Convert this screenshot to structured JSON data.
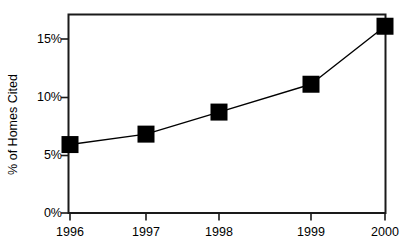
{
  "chart_data": {
    "type": "line",
    "title": "",
    "xlabel": "",
    "ylabel": "% of Homes Cited",
    "categories": [
      "1996",
      "1997",
      "1998",
      "1999",
      "2000"
    ],
    "values": [
      5.9,
      6.8,
      8.7,
      11.1,
      16.1
    ],
    "series": [
      {
        "name": "% of Homes Cited",
        "values": [
          5.9,
          6.8,
          8.7,
          11.1,
          16.1
        ]
      }
    ],
    "ylim": [
      0,
      17.25
    ],
    "xlim": [
      "1996",
      "2000"
    ],
    "y_ticks": [
      0,
      5,
      10,
      15
    ],
    "y_tick_labels": [
      "0%",
      "5%",
      "10%",
      "15%"
    ],
    "x_ticks": [
      "1996",
      "1997",
      "1998",
      "1999",
      "2000"
    ],
    "grid": false,
    "legend": "none",
    "marker": "square",
    "marker_color": "#000000",
    "line_color": "#000000",
    "frame_color": "#1a1a1a",
    "background_color": "#ffffff"
  },
  "axes": {
    "y_title": "% of Homes Cited",
    "y_tick_labels": [
      "15%",
      "10%",
      "5%",
      "0%"
    ],
    "x_tick_labels": [
      "1996",
      "1997",
      "1998",
      "1999",
      "2000"
    ]
  }
}
